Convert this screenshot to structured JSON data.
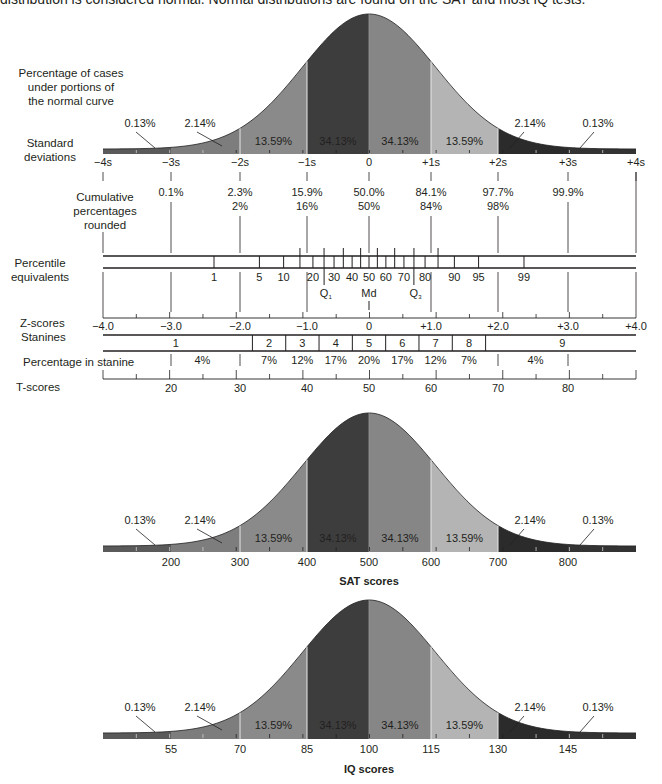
{
  "caption": "distribution is considered normal. Normal distributions are found on the SAT and most IQ tests.",
  "colors": {
    "tail": "#5a5a5a",
    "band_2_3": "#7d7d7d",
    "band_1_2_left": "#8a8a8a",
    "band_0_1_left": "#3d3d3d",
    "band_0_1_right": "#868686",
    "band_1_2_right": "#b4b4b4",
    "band_2_3_right": "#2b2b2b",
    "tail_right": "#333333",
    "line": "#231f20"
  },
  "main_chart": {
    "row_labels": {
      "percentage_cases": [
        "Percentage of cases",
        "under portions of",
        "the normal curve"
      ],
      "standard_deviations": [
        "Standard",
        "deviations"
      ],
      "cumulative": [
        "Cumulative",
        "percentages",
        "rounded"
      ],
      "percentile": [
        "Percentile",
        "equivalents"
      ],
      "zscores": "Z-scores",
      "stanines": "Stanines",
      "pct_in_stanine": "Percentage in stanine",
      "tscores": "T-scores"
    },
    "band_percentages": [
      "0.13%",
      "2.14%",
      "13.59%",
      "34.13%",
      "34.13%",
      "13.59%",
      "2.14%",
      "0.13%"
    ],
    "sd_labels": [
      "-4s",
      "-3s",
      "-2s",
      "-1s",
      "0",
      "+1s",
      "+2s",
      "+3s",
      "+4s"
    ],
    "cumulative_pct": [
      "0.1%",
      "2.3%",
      "15.9%",
      "50.0%",
      "84.1%",
      "97.7%",
      "99.9%"
    ],
    "cumulative_rounded": [
      "2%",
      "16%",
      "50%",
      "84%",
      "98%"
    ],
    "percentiles": [
      "1",
      "5",
      "10",
      "20",
      "30",
      "40",
      "50",
      "60",
      "70",
      "80",
      "90",
      "95",
      "99"
    ],
    "quartiles": [
      "Q1",
      "Md",
      "Q3"
    ],
    "zscores": [
      "-4.0",
      "-3.0",
      "-2.0",
      "-1.0",
      "0",
      "+1.0",
      "+2.0",
      "+3.0",
      "+4.0"
    ],
    "stanines": [
      "1",
      "2",
      "3",
      "4",
      "5",
      "6",
      "7",
      "8",
      "9"
    ],
    "stanine_pct": [
      "4%",
      "7%",
      "12%",
      "17%",
      "20%",
      "17%",
      "12%",
      "7%",
      "4%"
    ],
    "tscores": [
      "20",
      "30",
      "40",
      "50",
      "60",
      "70",
      "80"
    ]
  },
  "sat_chart": {
    "title": "SAT scores",
    "band_percentages": [
      "0.13%",
      "2.14%",
      "13.59%",
      "34.13%",
      "34.13%",
      "13.59%",
      "2.14%",
      "0.13%"
    ],
    "ticks": [
      "200",
      "300",
      "400",
      "500",
      "600",
      "700",
      "800"
    ]
  },
  "iq_chart": {
    "title": "IQ scores",
    "band_percentages": [
      "0.13%",
      "2.14%",
      "13.59%",
      "34.13%",
      "34.13%",
      "13.59%",
      "2.14%",
      "0.13%"
    ],
    "ticks": [
      "55",
      "70",
      "85",
      "100",
      "115",
      "130",
      "145"
    ]
  }
}
